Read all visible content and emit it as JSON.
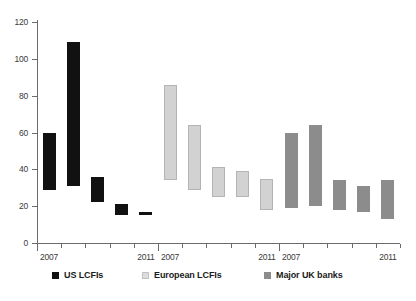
{
  "chart_data": {
    "type": "bar",
    "title": "",
    "subtitle": "",
    "xlabel": "",
    "ylabel": "",
    "ylim": [
      0,
      120
    ],
    "yticks": [
      0,
      20,
      40,
      60,
      80,
      100,
      120
    ],
    "grid": false,
    "legend_position": "bottom",
    "note": "Floating (range) bars: each bar spans from a low value to a high value for one year within each bank group.",
    "x_groups": [
      {
        "name": "US LCFIs",
        "first_tick_label": "2007",
        "last_tick_label": "2011",
        "years": [
          "2007",
          "2008",
          "2009",
          "2010",
          "2011"
        ]
      },
      {
        "name": "European LCFIs",
        "first_tick_label": "2007",
        "last_tick_label": "2011",
        "years": [
          "2007",
          "2008",
          "2009",
          "2010",
          "2011"
        ]
      },
      {
        "name": "Major UK banks",
        "first_tick_label": "2007",
        "last_tick_label": "2011",
        "years": [
          "2007",
          "2008",
          "2009",
          "2010",
          "2011"
        ]
      }
    ],
    "series": [
      {
        "name": "US LCFIs",
        "color": "#111111",
        "categories": [
          "2007",
          "2008",
          "2009",
          "2010",
          "2011"
        ],
        "low": [
          29,
          31,
          22,
          15,
          15
        ],
        "high": [
          60,
          109,
          36,
          21,
          17
        ]
      },
      {
        "name": "European LCFIs",
        "color": "#d2d2d2",
        "categories": [
          "2007",
          "2008",
          "2009",
          "2010",
          "2011"
        ],
        "low": [
          34,
          29,
          25,
          25,
          18
        ],
        "high": [
          86,
          64,
          41,
          39,
          35
        ]
      },
      {
        "name": "Major UK banks",
        "color": "#8c8c8c",
        "categories": [
          "2007",
          "2008",
          "2009",
          "2010",
          "2011"
        ],
        "low": [
          19,
          20,
          18,
          17,
          13
        ],
        "high": [
          60,
          64,
          34,
          31,
          34
        ]
      }
    ]
  },
  "axis": {
    "y_tick_labels": [
      "0",
      "20",
      "40",
      "60",
      "80",
      "100",
      "120"
    ],
    "x_tick_labels": [
      {
        "group": 0,
        "label": "2007"
      },
      {
        "group": 0,
        "label": "2011"
      },
      {
        "group": 1,
        "label": "2007"
      },
      {
        "group": 1,
        "label": "2011"
      },
      {
        "group": 2,
        "label": "2007"
      },
      {
        "group": 2,
        "label": "2011"
      }
    ]
  },
  "legend": {
    "items": [
      {
        "label": "US LCFIs",
        "color": "#111111",
        "key": "us"
      },
      {
        "label": "European LCFIs",
        "color": "#d2d2d2",
        "key": "eu"
      },
      {
        "label": "Major UK banks",
        "color": "#8c8c8c",
        "key": "uk"
      }
    ]
  }
}
